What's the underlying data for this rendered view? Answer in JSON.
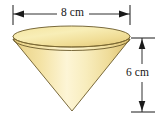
{
  "figure": {
    "name": "inverted-cone-geometry-figure",
    "shape": "cone",
    "orientation": "apex-down",
    "background_color": "#ffffff"
  },
  "dimensions": {
    "width": {
      "label": "8 cm",
      "value": 8,
      "unit": "cm",
      "measures": "diameter",
      "orientation": "horizontal",
      "position": "top"
    },
    "height": {
      "label": "6 cm",
      "value": 6,
      "unit": "cm",
      "measures": "height",
      "orientation": "vertical",
      "position": "right"
    }
  },
  "colors": {
    "cone_body_light": "#fdf3cf",
    "cone_body_mid": "#f3e2a0",
    "cone_body_dark": "#e3c878",
    "ellipse_top_light": "#f7e9ab",
    "ellipse_top_mid": "#f1e09c",
    "ellipse_top_dark": "#e0c679",
    "outline": "#6b5a2a",
    "dimension_line": "#1a1a1a",
    "text": "#161616"
  },
  "geometry": {
    "ellipse_center_x": 71.5,
    "ellipse_center_y": 39,
    "ellipse_rx": 58.5,
    "ellipse_ry": 11.5,
    "apex_x": 72,
    "apex_y": 111
  }
}
